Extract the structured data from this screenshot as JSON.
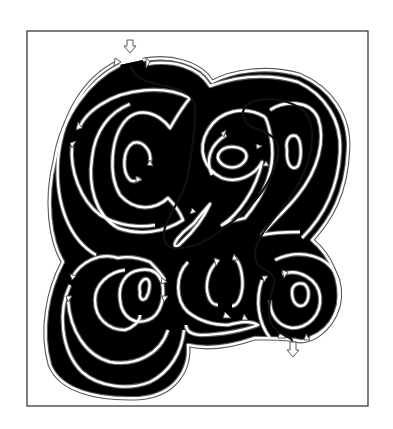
{
  "puzzle": {
    "type": "maze",
    "description": "Hand-drawn double-line maze shaped as interlocking swirls with one-way arrow passages and a highlighted solution path",
    "entry_label": "start arrow (top)",
    "exit_label": "finish arrow (bottom right)",
    "solution_shown": true
  },
  "colors": {
    "background": "#ffffff",
    "wall": "#5a5a5a",
    "frame": "#3a3a3a",
    "solution": "#111111"
  },
  "markers": [
    {
      "name": "entry-arrow",
      "x": 130,
      "y": 47,
      "direction": "down"
    },
    {
      "name": "exit-arrow",
      "x": 293,
      "y": 350,
      "direction": "down"
    }
  ]
}
